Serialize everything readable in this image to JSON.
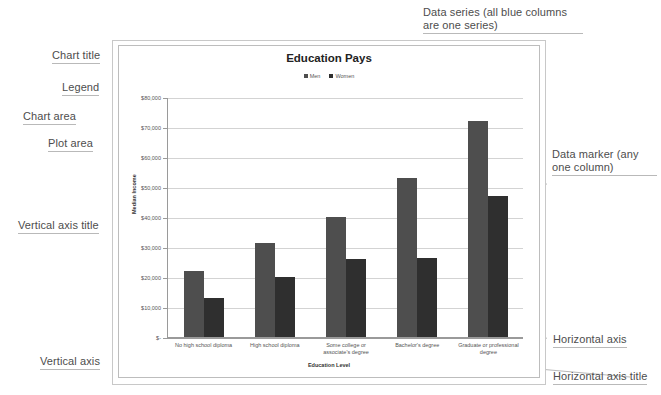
{
  "chart_data": {
    "type": "bar",
    "title": "Education Pays",
    "xlabel": "Education  Level",
    "ylabel": "Median Income",
    "categories": [
      "No high school diploma",
      "High school diploma",
      "Some college or associate's degree",
      "Bachelor's degree",
      "Graduate or professional degree"
    ],
    "series": [
      {
        "name": "Men",
        "color": "#4e4e4e",
        "values": [
          22000,
          31500,
          40000,
          53000,
          72000
        ]
      },
      {
        "name": "Women",
        "color": "#2f2f2f",
        "values": [
          13000,
          20000,
          26000,
          26500,
          47000
        ]
      }
    ],
    "ylim": [
      0,
      80000
    ],
    "ytick_values": [
      80000,
      70000,
      60000,
      50000,
      40000,
      30000,
      20000,
      10000,
      0
    ],
    "ytick_labels": [
      "$80,000",
      "$70,000",
      "$60,000",
      "$50,000",
      "$40,000",
      "$30,000",
      "$20,000",
      "$10,000",
      "$-"
    ],
    "grid": true,
    "legend_position": "top"
  },
  "annotations": {
    "chart_title": "Chart title",
    "legend": "Legend",
    "chart_area": "Chart area",
    "plot_area": "Plot area",
    "vertical_axis_title": "Vertical axis title",
    "vertical_axis": "Vertical axis",
    "data_series": "Data series (all blue columns are one series)",
    "data_marker": "Data marker (any one column)",
    "horizontal_axis": "Horizontal axis",
    "horizontal_axis_title": "Horizontal axis title"
  }
}
